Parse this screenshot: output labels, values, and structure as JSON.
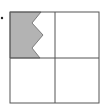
{
  "figure": {
    "colors": {
      "grid": "#555555",
      "shade": "#b3b3b3",
      "background": "#ffffff",
      "bullet": "#222222"
    },
    "grid": {
      "rows": 2,
      "cols": 2
    },
    "shaded_cell": "top-left"
  }
}
